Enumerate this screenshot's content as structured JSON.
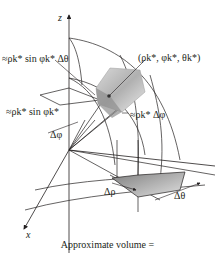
{
  "diagram": {
    "type": "spherical-coordinate-volume-element",
    "axes": {
      "z_label": "z",
      "x_label": "x",
      "y_label": ""
    },
    "labels": {
      "arc_dtheta_top": "≈ρk* sin φk* Δθ",
      "point": "(ρk*, φk*, θk*)",
      "arc_sin_phi": "≈ρk* sin φk*",
      "arc_dphi": "≈ρk* Δφ",
      "delta_phi": "Δφ",
      "delta_rho": "Δρ",
      "delta_theta": "Δθ"
    },
    "caption": "Approximate volume =",
    "colors": {
      "line": "#231f20",
      "shade_light": "#e6e6e6",
      "shade_mid": "#bdbdbd",
      "shade_dark": "#8c8c8c",
      "point": "#333333"
    }
  }
}
